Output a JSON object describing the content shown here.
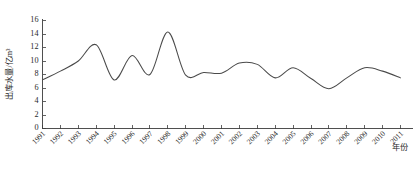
{
  "chart_data": {
    "type": "line",
    "title": "",
    "subtitle": "",
    "xlabel": "年份",
    "ylabel": "出库水量/亿m³",
    "xlim": [
      1991,
      2011
    ],
    "ylim": [
      0,
      16
    ],
    "grid": false,
    "legend": false,
    "legend_position": "none",
    "smoothed": true,
    "line_color": "#4a4a4a",
    "axis_color": "#3c3c3c",
    "x": [
      1991,
      1992,
      1993,
      1994,
      1995,
      1996,
      1997,
      1998,
      1999,
      2000,
      2001,
      2002,
      2003,
      2004,
      2005,
      2006,
      2007,
      2008,
      2009,
      2010,
      2011
    ],
    "categories": [
      "1991",
      "1992",
      "1993",
      "1994",
      "1995",
      "1996",
      "1997",
      "1998",
      "1999",
      "2000",
      "2001",
      "2002",
      "2003",
      "2004",
      "2005",
      "2006",
      "2007",
      "2008",
      "2009",
      "2010",
      "2011"
    ],
    "values": [
      7.2,
      8.5,
      10.0,
      12.4,
      7.2,
      10.8,
      8.0,
      14.3,
      7.9,
      8.3,
      8.2,
      9.7,
      9.5,
      7.5,
      9.0,
      7.4,
      5.9,
      7.5,
      9.0,
      8.5,
      7.5
    ],
    "series": [
      {
        "name": "出库水量",
        "values": [
          7.2,
          8.5,
          10.0,
          12.4,
          7.2,
          10.8,
          8.0,
          14.3,
          7.9,
          8.3,
          8.2,
          9.7,
          9.5,
          7.5,
          9.0,
          7.4,
          5.9,
          7.5,
          9.0,
          8.5,
          7.5
        ]
      }
    ],
    "ytick_labels": [
      "0",
      "2",
      "4",
      "6",
      "8",
      "10",
      "12",
      "14",
      "16"
    ],
    "ytick_values": [
      0,
      2,
      4,
      6,
      8,
      10,
      12,
      14,
      16
    ],
    "xtick_labels": [
      "1991",
      "1992",
      "1993",
      "1994",
      "1995",
      "1996",
      "1997",
      "1998",
      "1999",
      "2000",
      "2001",
      "2002",
      "2003",
      "2004",
      "2005",
      "2006",
      "2007",
      "2008",
      "2009",
      "2010",
      "2011"
    ]
  }
}
